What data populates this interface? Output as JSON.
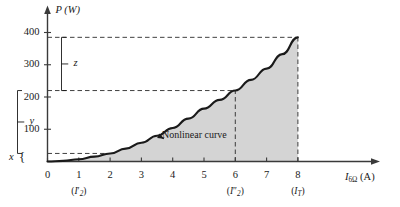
{
  "chart_data": {
    "type": "line",
    "title": "",
    "xlabel": "I6Ω (A)",
    "ylabel": "P (W)",
    "xlim": [
      0,
      9.1
    ],
    "ylim": [
      0,
      440
    ],
    "grid": false,
    "legend": null,
    "x_ticks": [
      "0",
      "1",
      "2",
      "3",
      "4",
      "5",
      "6",
      "7",
      "8"
    ],
    "x_tick_values": [
      0,
      1,
      2,
      3,
      4,
      5,
      6,
      7,
      8
    ],
    "y_ticks": [
      "100",
      "200",
      "300",
      "400"
    ],
    "y_tick_values": [
      100,
      200,
      300,
      400
    ],
    "series": [
      {
        "name": "Nonlinear curve",
        "x": [
          0,
          0.5,
          1,
          1.5,
          2,
          2.5,
          3,
          3.5,
          4,
          4.5,
          5,
          5.5,
          6,
          6.5,
          7,
          7.5,
          8
        ],
        "y": [
          0,
          2,
          7,
          15,
          25,
          40,
          58,
          80,
          104,
          133,
          164,
          191,
          220,
          253,
          288,
          333,
          385
        ]
      }
    ],
    "shaded_region": {
      "label": "area-under-curve",
      "x_from": 0,
      "x_to": 8,
      "color": "#d4d4d4"
    },
    "markers": [
      {
        "name": "marker-I2-prime",
        "x": 1,
        "y": 7
      },
      {
        "name": "marker-I2-double-prime",
        "x": 6,
        "y": 220
      },
      {
        "name": "marker-IT",
        "x": 8,
        "y": 385
      }
    ],
    "guide_lines": [
      {
        "name": "hline-385",
        "type": "horizontal",
        "value": 385,
        "from_x": 0,
        "to_x": 8
      },
      {
        "name": "hline-220",
        "type": "horizontal",
        "value": 220,
        "from_x": 0,
        "to_x": 6
      },
      {
        "name": "hline-25",
        "type": "horizontal",
        "value": 25,
        "from_x": 0,
        "to_x": 1.85
      },
      {
        "name": "vline-6",
        "type": "vertical",
        "value": 6,
        "from_y": 0,
        "to_y": 220
      },
      {
        "name": "vline-8",
        "type": "vertical",
        "value": 8,
        "from_y": 0,
        "to_y": 385
      }
    ],
    "annotations": [
      {
        "name": "curve-callout",
        "text": "Nonlinear curve",
        "x": 3.8,
        "y": 72
      },
      {
        "name": "brace-x",
        "text": "x",
        "value_range": [
          0,
          25
        ]
      },
      {
        "name": "brace-y",
        "text": "y",
        "value_range": [
          25,
          220
        ]
      },
      {
        "name": "brace-z",
        "text": "z",
        "value_range": [
          220,
          385
        ]
      }
    ]
  },
  "axes": {
    "y_axis_title": "P (W)",
    "x_axis_title_symbol": "I",
    "x_axis_title_sub": "6Ω",
    "x_axis_title_unit": "(A)"
  },
  "ticks": {
    "x": [
      {
        "label": "0",
        "value": 0
      },
      {
        "label": "1",
        "value": 1
      },
      {
        "label": "2",
        "value": 2
      },
      {
        "label": "3",
        "value": 3
      },
      {
        "label": "4",
        "value": 4
      },
      {
        "label": "5",
        "value": 5
      },
      {
        "label": "6",
        "value": 6
      },
      {
        "label": "7",
        "value": 7
      },
      {
        "label": "8",
        "value": 8
      }
    ],
    "y": [
      {
        "label": "100",
        "value": 100
      },
      {
        "label": "200",
        "value": 200
      },
      {
        "label": "300",
        "value": 300
      },
      {
        "label": "400",
        "value": 400
      }
    ]
  },
  "current_labels": [
    {
      "name": "label-I2-prime",
      "symbol": "I",
      "prime": "′",
      "sub": "2",
      "at_tick": 1
    },
    {
      "name": "label-I2-double-prime",
      "symbol": "I",
      "prime": "″",
      "sub": "2",
      "at_tick": 6
    },
    {
      "name": "label-IT",
      "symbol": "I",
      "prime": "",
      "sub": "T",
      "at_tick": 8
    }
  ],
  "braces": {
    "x_label": "x",
    "y_label": "y",
    "z_label": "z"
  },
  "callout": {
    "text": "Nonlinear curve"
  },
  "colors": {
    "curve": "#1a1a1a",
    "fill": "#d4d4d4",
    "axis": "#3a3a3a",
    "dashed": "#2b2b2b",
    "text": "#1a1a1a"
  }
}
